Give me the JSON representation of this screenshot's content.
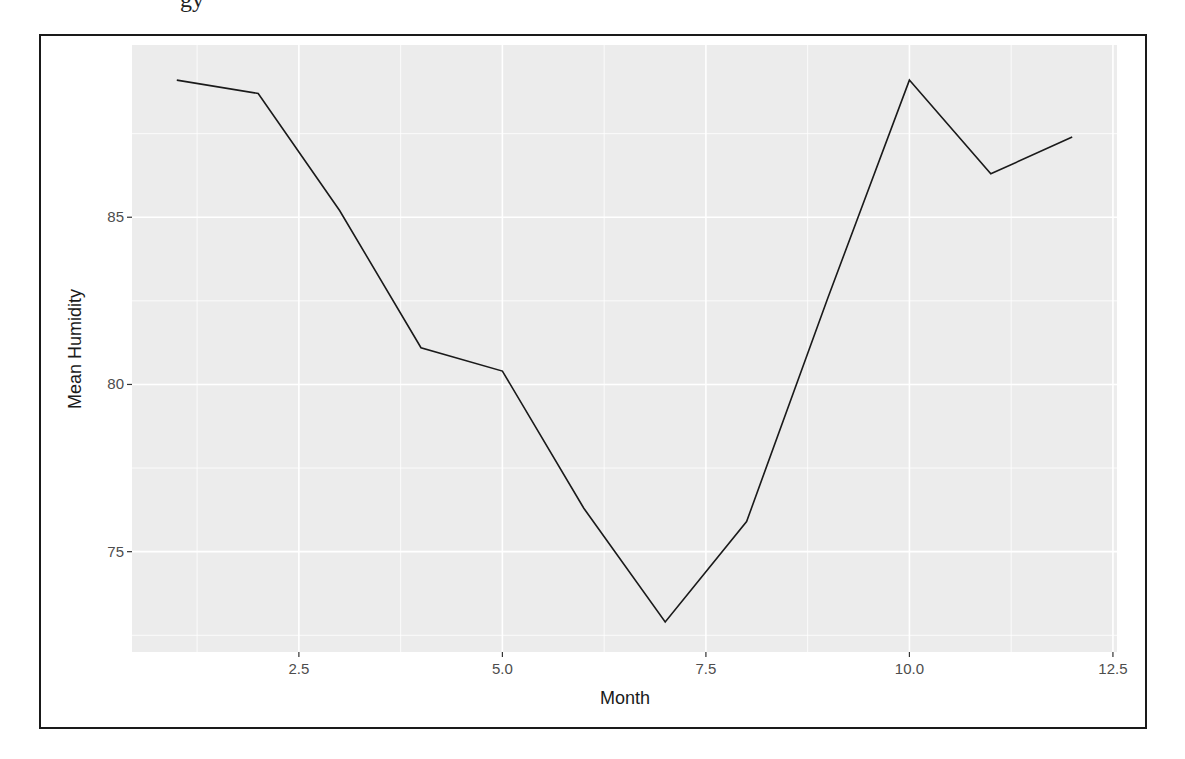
{
  "chart_data": {
    "type": "line",
    "title": "",
    "xlabel": "Month",
    "ylabel": "Mean Humidity",
    "x": [
      1,
      2,
      3,
      4,
      5,
      6,
      7,
      8,
      9,
      10,
      11,
      12
    ],
    "series": [
      {
        "name": "Mean Humidity",
        "color": "#1a1a1a",
        "values": [
          89.1,
          88.7,
          85.2,
          81.1,
          80.4,
          76.3,
          72.9,
          75.9,
          82.6,
          89.1,
          86.3,
          87.4
        ]
      }
    ],
    "xlim": [
      0.45,
      12.55
    ],
    "ylim": [
      72.0,
      90.15
    ],
    "x_ticks": [
      2.5,
      5.0,
      7.5,
      10.0,
      12.5
    ],
    "x_tick_labels": [
      "2.5",
      "5.0",
      "7.5",
      "10.0",
      "12.5"
    ],
    "y_ticks": [
      75,
      80,
      85
    ],
    "y_tick_labels": [
      "75",
      "80",
      "85"
    ],
    "grid": true,
    "legend": "none",
    "panel_background": "#ececec",
    "grid_color": "#ffffff"
  }
}
